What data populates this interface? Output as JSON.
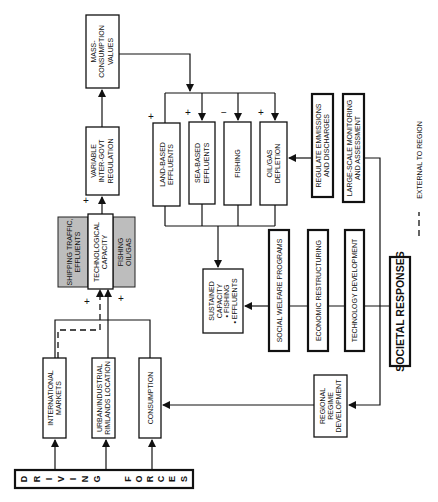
{
  "diagram": {
    "nodes": {
      "mass_consumption": {
        "lines": [
          "MASS-",
          "CONSUMPTION",
          "VALUES"
        ]
      },
      "variable_regulation": {
        "lines": [
          "VARIABLE",
          "INTER-GOVT",
          "REGULATION"
        ]
      },
      "land_based": {
        "lines": [
          "LAND-BASED",
          "EFFLUENTS"
        ]
      },
      "sea_based": {
        "lines": [
          "SEA-BASED",
          "EFFLUENTS"
        ]
      },
      "fishing": {
        "lines": [
          "FISHING"
        ]
      },
      "oil_gas_depletion": {
        "lines": [
          "OIL/GAS",
          "DEPLETION"
        ]
      },
      "regulate_emissions": {
        "lines": [
          "REGULATE EMMISSIONS",
          "AND DISCHARGES"
        ]
      },
      "large_scale_monitoring": {
        "lines": [
          "LARGE-SCALE MONITORING",
          "AND ASSESSMENT"
        ]
      },
      "shipping_traffic": {
        "lines": [
          "SHIPPING TRAFFIC,",
          "EFFLUENTS"
        ]
      },
      "technological_capacity": {
        "lines": [
          "TECHNOLOGICAL",
          "CAPACITY"
        ]
      },
      "fishing_oilgas": {
        "lines": [
          "FISHING",
          "OIL/GAS"
        ]
      },
      "sustained_capacity": {
        "lines": [
          "SUSTAINED",
          "CAPACITY",
          "• FISHING",
          "• EFFLUENTS"
        ]
      },
      "social_welfare": {
        "lines": [
          "SOCIAL WELFARE PROGRAMS"
        ]
      },
      "economic_restructuring": {
        "lines": [
          "ECONOMIC RESTRUCTURING"
        ]
      },
      "technology_development": {
        "lines": [
          "TECHNOLOGY DEVELOPMENT"
        ]
      },
      "societal_responses": {
        "lines": [
          "SOCIETAL RESPONSES"
        ]
      },
      "regional_regime": {
        "lines": [
          "REGIONAL",
          "REGIME",
          "DEVELOPMENT"
        ]
      },
      "international_markets": {
        "lines": [
          "INTERNATIONAL",
          "MARKETS"
        ]
      },
      "urban_industrial": {
        "lines": [
          "URBAN/INDUSTRIAL",
          "RIMLANDS LOCATION"
        ]
      },
      "consumption": {
        "lines": [
          "CONSUMPTION"
        ]
      },
      "driving_forces": {
        "letters": [
          "D",
          "R",
          "I",
          "V",
          "I",
          "N",
          "G",
          "F",
          "O",
          "R",
          "C",
          "E",
          "S"
        ]
      }
    },
    "signs": {
      "land_based": "+",
      "sea_based": "+",
      "fishing": "−",
      "oil_gas": "+",
      "regulation_in": "+",
      "tech_left": "+",
      "tech_right": "+"
    },
    "legend": {
      "dashed_label": "EXTERNAL TO REGION"
    },
    "colors": {
      "line": "#111111",
      "shade": "#bdbdbd",
      "background": "#ffffff"
    }
  }
}
